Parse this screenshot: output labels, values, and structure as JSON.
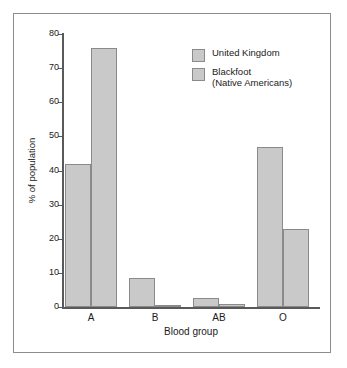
{
  "chart_data": {
    "type": "bar",
    "title": "",
    "subtitle": "",
    "xlabel": "Blood group",
    "ylabel": "% of population",
    "categories": [
      "A",
      "B",
      "AB",
      "O"
    ],
    "series": [
      {
        "name": "United Kingdom",
        "values": [
          42,
          8.5,
          2.5,
          47
        ]
      },
      {
        "name": "Blackfoot\n(Native Americans)",
        "values": [
          76,
          0.4,
          1,
          23
        ]
      }
    ],
    "ylim": [
      0,
      80
    ],
    "ytick_values": [
      0,
      10,
      20,
      30,
      40,
      50,
      60,
      70,
      80
    ],
    "ytick_labels": [
      "0",
      "10",
      "20",
      "30",
      "40",
      "50",
      "60",
      "70",
      "80"
    ],
    "grid": false,
    "legend_position": "upper right",
    "colors": {
      "bar_fill": "#c9c9c9",
      "bar_border": "#8a8a8a",
      "axis": "#58595b",
      "frame_border": "#8c8c8c",
      "text": "#1a1a1a",
      "background": "#ffffff"
    }
  },
  "legend": {
    "entries": [
      {
        "label": "United Kingdom",
        "swatch_name": "legend-swatch-united-kingdom"
      },
      {
        "label": "Blackfoot\n(Native Americans)",
        "swatch_name": "legend-swatch-blackfoot"
      }
    ]
  }
}
